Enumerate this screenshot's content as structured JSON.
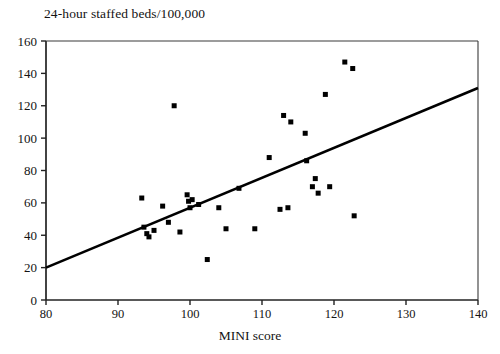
{
  "chart_data": {
    "type": "scatter",
    "title": "24-hour staffed beds/100,000",
    "subtitle": "",
    "xlabel": "MINI score",
    "ylabel": "",
    "xlim": [
      80,
      140
    ],
    "ylim": [
      0,
      160
    ],
    "xticks": [
      80,
      90,
      100,
      110,
      120,
      130,
      140
    ],
    "yticks": [
      0,
      20,
      40,
      60,
      80,
      100,
      120,
      140,
      160
    ],
    "grid": false,
    "legend": false,
    "marker_color": "#000000",
    "line_color": "#000000",
    "frame_color": "#3a3a3a",
    "points": [
      {
        "x": 93.3,
        "y": 63
      },
      {
        "x": 93.6,
        "y": 45
      },
      {
        "x": 94.0,
        "y": 41
      },
      {
        "x": 94.3,
        "y": 39
      },
      {
        "x": 95.0,
        "y": 43
      },
      {
        "x": 96.2,
        "y": 58
      },
      {
        "x": 97.0,
        "y": 48
      },
      {
        "x": 97.8,
        "y": 120
      },
      {
        "x": 98.6,
        "y": 42
      },
      {
        "x": 99.6,
        "y": 65
      },
      {
        "x": 99.8,
        "y": 61
      },
      {
        "x": 100.0,
        "y": 57
      },
      {
        "x": 100.3,
        "y": 62
      },
      {
        "x": 101.2,
        "y": 59
      },
      {
        "x": 102.4,
        "y": 25
      },
      {
        "x": 104.0,
        "y": 57
      },
      {
        "x": 105.0,
        "y": 44
      },
      {
        "x": 106.8,
        "y": 69
      },
      {
        "x": 109.0,
        "y": 44
      },
      {
        "x": 111.0,
        "y": 88
      },
      {
        "x": 112.5,
        "y": 56
      },
      {
        "x": 113.0,
        "y": 114
      },
      {
        "x": 113.6,
        "y": 57
      },
      {
        "x": 114.0,
        "y": 110
      },
      {
        "x": 116.0,
        "y": 103
      },
      {
        "x": 116.2,
        "y": 86
      },
      {
        "x": 117.0,
        "y": 70
      },
      {
        "x": 117.4,
        "y": 75
      },
      {
        "x": 117.8,
        "y": 66
      },
      {
        "x": 118.8,
        "y": 127
      },
      {
        "x": 119.4,
        "y": 70
      },
      {
        "x": 121.5,
        "y": 147
      },
      {
        "x": 122.6,
        "y": 143
      },
      {
        "x": 122.8,
        "y": 52
      }
    ],
    "trend_line": {
      "x_start": 80,
      "y_start": 20,
      "x_end": 140,
      "y_end": 131
    }
  }
}
